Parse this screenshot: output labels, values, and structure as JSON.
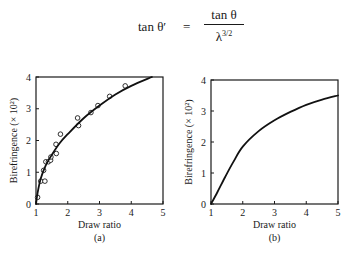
{
  "equation": {
    "lhs": "tan θ′",
    "equals": "=",
    "numerator": "tan θ",
    "denominator_base": "λ",
    "denominator_exp": "3/2"
  },
  "chart_data": [
    {
      "type": "scatter",
      "panel_label": "(a)",
      "title": "",
      "xlabel": "Draw ratio",
      "ylabel": "Birefringence (× 10²)",
      "xlim": [
        1,
        5
      ],
      "ylim": [
        0,
        4
      ],
      "xticks": [
        "1",
        "2",
        "3",
        "4",
        "5"
      ],
      "yticks": [
        "0",
        "1",
        "2",
        "3",
        "4"
      ],
      "grid": false,
      "legend": null,
      "series": [
        {
          "name": "measured",
          "kind": "scatter",
          "marker": "open-circle",
          "points": [
            [
              1.05,
              0.21
            ],
            [
              1.15,
              0.72
            ],
            [
              1.28,
              0.72
            ],
            [
              1.24,
              1.06
            ],
            [
              1.31,
              1.33
            ],
            [
              1.39,
              1.33
            ],
            [
              1.46,
              1.38
            ],
            [
              1.47,
              1.48
            ],
            [
              1.64,
              1.59
            ],
            [
              1.63,
              1.88
            ],
            [
              1.77,
              2.2
            ],
            [
              2.31,
              2.71
            ],
            [
              2.34,
              2.47
            ],
            [
              2.73,
              2.88
            ],
            [
              2.95,
              3.1
            ],
            [
              3.32,
              3.39
            ],
            [
              3.81,
              3.72
            ]
          ]
        },
        {
          "name": "fit",
          "kind": "line",
          "points": [
            [
              1.0,
              0.0
            ],
            [
              1.05,
              0.35
            ],
            [
              1.15,
              0.8
            ],
            [
              1.3,
              1.2
            ],
            [
              1.5,
              1.55
            ],
            [
              1.75,
              1.92
            ],
            [
              2.0,
              2.2
            ],
            [
              2.5,
              2.7
            ],
            [
              3.0,
              3.1
            ],
            [
              3.5,
              3.45
            ],
            [
              4.0,
              3.72
            ],
            [
              4.65,
              4.0
            ]
          ]
        }
      ]
    },
    {
      "type": "line",
      "panel_label": "(b)",
      "title": "",
      "xlabel": "Draw ratio",
      "ylabel": "Birefringence (× 10²)",
      "xlim": [
        1,
        5
      ],
      "ylim": [
        0,
        4
      ],
      "xticks": [
        "1",
        "2",
        "3",
        "4",
        "5"
      ],
      "yticks": [
        "0",
        "1",
        "2",
        "3",
        "4"
      ],
      "grid": false,
      "legend": null,
      "series": [
        {
          "name": "theory",
          "kind": "line",
          "points": [
            [
              1.0,
              0.0
            ],
            [
              1.2,
              0.38
            ],
            [
              1.45,
              0.88
            ],
            [
              1.7,
              1.35
            ],
            [
              2.0,
              1.85
            ],
            [
              2.5,
              2.35
            ],
            [
              3.0,
              2.7
            ],
            [
              3.5,
              2.97
            ],
            [
              4.0,
              3.2
            ],
            [
              4.5,
              3.37
            ],
            [
              5.0,
              3.5
            ]
          ]
        }
      ]
    }
  ]
}
